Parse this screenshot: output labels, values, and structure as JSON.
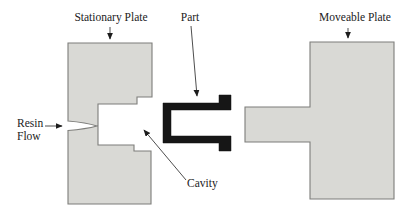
{
  "figure": {
    "labels": {
      "stationary_plate": "Stationary Plate",
      "part": "Part",
      "moveable_plate": "Moveable Plate",
      "resin_line1": "Resin",
      "resin_line2": "Flow",
      "cavity": "Cavity"
    },
    "colors": {
      "plate_fill": "#d9d9d5",
      "plate_stroke": "#7d7d7a",
      "part_fill": "#161616",
      "leader_line": "#3a3a3a",
      "text": "#222222",
      "background": "#ffffff"
    }
  }
}
